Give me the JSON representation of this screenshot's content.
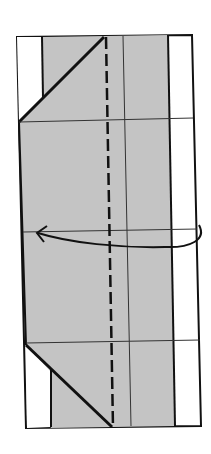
{
  "diagram": {
    "type": "origami-fold-step",
    "colors": {
      "background": "#ffffff",
      "paper_shaded": "#c4c4c4",
      "paper_white": "#ffffff",
      "outline": "#111111",
      "crease": "#333333"
    },
    "annotations": {
      "valley_fold_line": "dashed vertical line",
      "fold_arrow": "curved arrow pointing left — fold right side over to the left",
      "creases": "thin horizontal and vertical crease lines"
    }
  }
}
